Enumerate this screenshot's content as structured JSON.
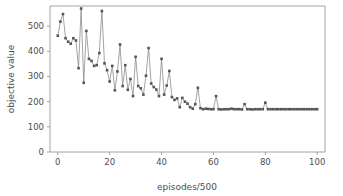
{
  "chart_data": {
    "type": "line",
    "title": "",
    "xlabel": "episodes/500",
    "ylabel": "objective value",
    "xlim": [
      -3,
      103
    ],
    "ylim": [
      0,
      580
    ],
    "xticks": [
      0,
      20,
      40,
      60,
      80,
      100
    ],
    "yticks": [
      0,
      100,
      200,
      300,
      400,
      500
    ],
    "grid": false,
    "legend": null,
    "marker": "square",
    "marker_color": "#555555",
    "line_color": "#8c8c8c",
    "series": [
      {
        "name": "objective value",
        "x": [
          0,
          1,
          2,
          3,
          4,
          5,
          6,
          7,
          8,
          9,
          10,
          11,
          12,
          13,
          14,
          15,
          16,
          17,
          18,
          19,
          20,
          21,
          22,
          23,
          24,
          25,
          26,
          27,
          28,
          29,
          30,
          31,
          32,
          33,
          34,
          35,
          36,
          37,
          38,
          39,
          40,
          41,
          42,
          43,
          44,
          45,
          46,
          47,
          48,
          49,
          50,
          51,
          52,
          53,
          54,
          55,
          56,
          57,
          58,
          59,
          60,
          61,
          62,
          63,
          64,
          65,
          66,
          67,
          68,
          69,
          70,
          71,
          72,
          73,
          74,
          75,
          76,
          77,
          78,
          79,
          80,
          81,
          82,
          83,
          84,
          85,
          86,
          87,
          88,
          89,
          90,
          91,
          92,
          93,
          94,
          95,
          96,
          97,
          98,
          99,
          100
        ],
        "values": [
          462,
          518,
          548,
          452,
          438,
          430,
          452,
          443,
          333,
          570,
          275,
          481,
          370,
          362,
          342,
          345,
          393,
          560,
          352,
          325,
          280,
          342,
          245,
          320,
          427,
          262,
          345,
          247,
          290,
          222,
          378,
          262,
          253,
          228,
          303,
          413,
          272,
          258,
          248,
          222,
          370,
          228,
          264,
          322,
          218,
          207,
          213,
          178,
          215,
          200,
          192,
          178,
          172,
          190,
          255,
          174,
          170,
          172,
          171,
          170,
          170,
          222,
          170,
          169,
          170,
          170,
          170,
          172,
          170,
          170,
          170,
          169,
          190,
          170,
          170,
          169,
          170,
          170,
          170,
          170,
          196,
          170,
          170,
          170,
          170,
          170,
          170,
          170,
          170,
          170,
          170,
          170,
          170,
          170,
          170,
          170,
          170,
          170,
          170,
          170,
          170
        ]
      }
    ]
  },
  "axes": {
    "xtick_labels": [
      "0",
      "20",
      "40",
      "60",
      "80",
      "100"
    ],
    "ytick_labels": [
      "0",
      "100",
      "200",
      "300",
      "400",
      "500"
    ],
    "xlabel": "episodes/500",
    "ylabel": "objective value"
  }
}
